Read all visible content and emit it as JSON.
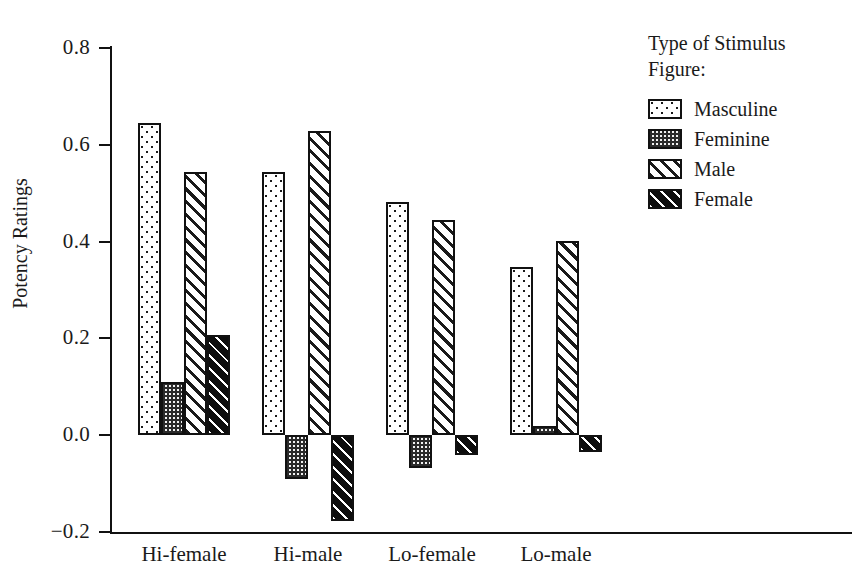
{
  "chart_data": {
    "type": "bar",
    "title": "",
    "subtitle": "",
    "xlabel": "",
    "ylabel": "Potency Ratings",
    "ylim": [
      -0.2,
      0.8
    ],
    "ytick_labels": [
      "0.8",
      "0.6",
      "0.4",
      "0.2",
      "0.0",
      "-0.2"
    ],
    "ytick_values": [
      0.8,
      0.6,
      0.4,
      0.2,
      0.0,
      -0.2
    ],
    "grid": false,
    "legend_position": "top-right",
    "legend_title": "Type of Stimulus Figure:",
    "categories": [
      "Hi-female",
      "Hi-male",
      "Lo-female",
      "Lo-male"
    ],
    "series": [
      {
        "name": "Masculine",
        "pattern": "sparse-dots",
        "values": [
          0.645,
          0.543,
          0.481,
          0.347
        ]
      },
      {
        "name": "Feminine",
        "pattern": "dense-checker",
        "values": [
          0.11,
          -0.09,
          -0.067,
          0.019
        ]
      },
      {
        "name": "Male",
        "pattern": "diagonal-hatch",
        "values": [
          0.543,
          0.628,
          0.445,
          0.401
        ]
      },
      {
        "name": "Female",
        "pattern": "dark-diagonal-hatch",
        "values": [
          0.208,
          -0.178,
          -0.04,
          -0.035
        ]
      }
    ]
  },
  "axis": {
    "y_title": "Potency Ratings",
    "ticks": [
      {
        "label": "0.8"
      },
      {
        "label": "0.6"
      },
      {
        "label": "0.4"
      },
      {
        "label": "0.2"
      },
      {
        "label": "0.0"
      },
      {
        "label": "−0.2"
      }
    ]
  },
  "legend": {
    "title_line1": "Type of Stimulus",
    "title_line2": "Figure:",
    "entries": [
      {
        "label": "Masculine"
      },
      {
        "label": "Feminine"
      },
      {
        "label": "Male"
      },
      {
        "label": "Female"
      }
    ]
  },
  "x_labels": [
    {
      "label": "Hi-female"
    },
    {
      "label": "Hi-male"
    },
    {
      "label": "Lo-female"
    },
    {
      "label": "Lo-male"
    }
  ],
  "colors": {
    "ink": "#111111",
    "background": "#ffffff",
    "dark_fill": "#0d0d0d",
    "mid_fill": "#f2f2f2"
  }
}
